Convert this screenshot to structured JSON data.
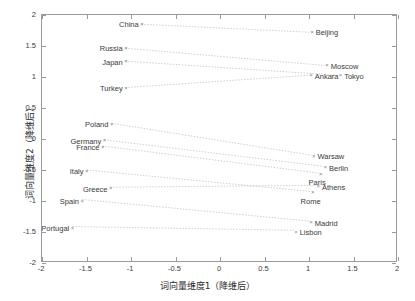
{
  "axes": {
    "xlabel": "词向量维度1（降维后）",
    "ylabel": "词向量维度2（降维后）",
    "xticks": [
      "-2",
      "-1.5",
      "-1",
      "-0.5",
      "0",
      "0.5",
      "1",
      "1.5",
      "2"
    ],
    "yticks": [
      "2",
      "1.5",
      "1",
      "0.5",
      "0",
      "-0.5",
      "-1",
      "-1.5",
      "-2"
    ]
  },
  "chart_data": {
    "type": "scatter",
    "title": "",
    "xlabel": "词向量维度1（降维后）",
    "ylabel": "词向量维度2（降维后）",
    "xlim": [
      -2,
      2
    ],
    "ylim": [
      -2,
      2
    ],
    "xticks": [
      -2,
      -1.5,
      -1,
      -0.5,
      0,
      0.5,
      1,
      1.5,
      2
    ],
    "yticks": [
      -2,
      -1.5,
      -1,
      -0.5,
      0,
      0.5,
      1,
      1.5,
      2
    ],
    "grid": false,
    "legend": null,
    "annotations": "dotted lines connect each country to its capital",
    "points": [
      {
        "label": "China",
        "x": -0.88,
        "y": 1.85,
        "side": "left"
      },
      {
        "label": "Beijing",
        "x": 1.03,
        "y": 1.72,
        "side": "right"
      },
      {
        "label": "Russia",
        "x": -1.06,
        "y": 1.46,
        "side": "left"
      },
      {
        "label": "Moscow",
        "x": 1.2,
        "y": 1.18,
        "side": "right"
      },
      {
        "label": "Japan",
        "x": -1.06,
        "y": 1.25,
        "side": "left"
      },
      {
        "label": "Tokyo",
        "x": 1.35,
        "y": 1.02,
        "side": "right"
      },
      {
        "label": "Turkey",
        "x": -1.06,
        "y": 0.82,
        "side": "left"
      },
      {
        "label": "Ankara",
        "x": 1.02,
        "y": 1.02,
        "side": "right"
      },
      {
        "label": "Poland",
        "x": -1.22,
        "y": 0.24,
        "side": "left"
      },
      {
        "label": "Warsaw",
        "x": 1.05,
        "y": -0.28,
        "side": "right"
      },
      {
        "label": "Germany",
        "x": -1.3,
        "y": -0.03,
        "side": "left"
      },
      {
        "label": "Berlin",
        "x": 1.18,
        "y": -0.46,
        "side": "right"
      },
      {
        "label": "France",
        "x": -1.32,
        "y": -0.13,
        "side": "left"
      },
      {
        "label": "Paris",
        "x": 1.13,
        "y": -0.57,
        "side": "below"
      },
      {
        "label": "Italy",
        "x": -1.5,
        "y": -0.52,
        "side": "left"
      },
      {
        "label": "Rome",
        "x": 1.04,
        "y": -0.87,
        "side": "below"
      },
      {
        "label": "Greece",
        "x": -1.23,
        "y": -0.8,
        "side": "left"
      },
      {
        "label": "Athens",
        "x": 1.1,
        "y": -0.77,
        "side": "right"
      },
      {
        "label": "Spain",
        "x": -1.55,
        "y": -1.0,
        "side": "left"
      },
      {
        "label": "Madrid",
        "x": 1.02,
        "y": -1.35,
        "side": "right"
      },
      {
        "label": "Portugal",
        "x": -1.66,
        "y": -1.44,
        "side": "left"
      },
      {
        "label": "Lisbon",
        "x": 0.85,
        "y": -1.5,
        "side": "right"
      }
    ],
    "pairs": [
      [
        "China",
        "Beijing"
      ],
      [
        "Russia",
        "Moscow"
      ],
      [
        "Japan",
        "Tokyo"
      ],
      [
        "Turkey",
        "Ankara"
      ],
      [
        "Poland",
        "Warsaw"
      ],
      [
        "Germany",
        "Berlin"
      ],
      [
        "France",
        "Paris"
      ],
      [
        "Italy",
        "Rome"
      ],
      [
        "Greece",
        "Athens"
      ],
      [
        "Spain",
        "Madrid"
      ],
      [
        "Portugal",
        "Lisbon"
      ]
    ]
  }
}
